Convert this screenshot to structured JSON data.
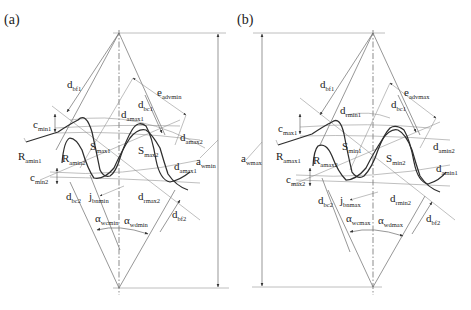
{
  "figure": {
    "panels": [
      {
        "id": "a",
        "panel_label": "(a)",
        "labels": {
          "d_bf1": {
            "main": "d",
            "sub": "bf1"
          },
          "e_advmin": {
            "main": "e",
            "sub": "advmin"
          },
          "d_bc1": {
            "main": "d",
            "sub": "bc1"
          },
          "d_amax1": {
            "main": "d",
            "sub": "amax1"
          },
          "c_min1": {
            "main": "c",
            "sub": "min1"
          },
          "d_amax2": {
            "main": "d",
            "sub": "amax2"
          },
          "R_amin1": {
            "main": "R",
            "sub": "amin1"
          },
          "R_amin2": {
            "main": "R",
            "sub": "amin2"
          },
          "S_max1": {
            "main": "S",
            "sub": "max1"
          },
          "S_max2": {
            "main": "S",
            "sub": "max2"
          },
          "a_wmin": {
            "main": "a",
            "sub": "wmin"
          },
          "c_min2": {
            "main": "c",
            "sub": "min2"
          },
          "d_amax1b": {
            "main": "d",
            "sub": "amax1"
          },
          "d_bc2": {
            "main": "d",
            "sub": "bc2"
          },
          "j_bnmin": {
            "main": "j",
            "sub": "bnmin"
          },
          "d_amax2b": {
            "main": "d",
            "sub": "rmax2"
          },
          "alpha_wcmin": {
            "main": "α",
            "sub": "wcmin"
          },
          "alpha_wdmin": {
            "main": "α",
            "sub": "wdmin"
          },
          "d_bf2": {
            "main": "d",
            "sub": "bf2"
          }
        }
      },
      {
        "id": "b",
        "panel_label": "(b)",
        "labels": {
          "d_bf1": {
            "main": "d",
            "sub": "bf1"
          },
          "e_advmax": {
            "main": "e",
            "sub": "advmax"
          },
          "d_bc1": {
            "main": "d",
            "sub": "bc1"
          },
          "d_rmin1": {
            "main": "d",
            "sub": "rmin1"
          },
          "c_max1": {
            "main": "c",
            "sub": "max1"
          },
          "d_amin2": {
            "main": "d",
            "sub": "amin2"
          },
          "a_wmax": {
            "main": "a",
            "sub": "wmax"
          },
          "R_amax1": {
            "main": "R",
            "sub": "amax1"
          },
          "R_amax2": {
            "main": "R",
            "sub": "amax2"
          },
          "S_min1": {
            "main": "S",
            "sub": "min1"
          },
          "S_min2": {
            "main": "S",
            "sub": "min2"
          },
          "c_max2": {
            "main": "c",
            "sub": "max2"
          },
          "d_amin1": {
            "main": "d",
            "sub": "amin1"
          },
          "d_bc2": {
            "main": "d",
            "sub": "bc2"
          },
          "j_bnmax": {
            "main": "j",
            "sub": "bnmax"
          },
          "d_rmin2": {
            "main": "d",
            "sub": "rmin2"
          },
          "alpha_wcmax": {
            "main": "α",
            "sub": "wcmax"
          },
          "alpha_wdmax": {
            "main": "α",
            "sub": "wdmax"
          },
          "d_bf2": {
            "main": "d",
            "sub": "bf2"
          }
        }
      }
    ]
  }
}
